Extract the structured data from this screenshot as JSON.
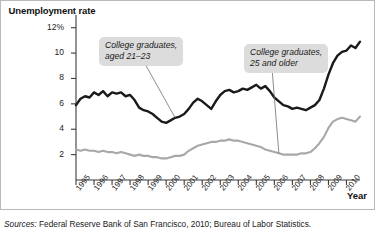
{
  "figure": {
    "y_axis_title": "Unemployment rate",
    "x_axis_title": "Year",
    "source_label": "Sources:",
    "source_text": " Federal Reserve Bank of San Francisco, 2010; Bureau of Labor Statistics."
  },
  "callouts": [
    {
      "id": "grads-21-23",
      "line1": "College graduates,",
      "line2": "aged 21–23"
    },
    {
      "id": "grads-25-older",
      "line1": "College graduates,",
      "line2": "25 and older"
    }
  ],
  "colors": {
    "series_young": "#1a1a1a",
    "series_older": "#a8a8a8",
    "axis": "#3b3b3b",
    "callout_bg": "#dcdcdc",
    "frame": "#b9b9b9",
    "background": "#ffffff"
  },
  "chart_data": {
    "type": "line",
    "title": "",
    "xlabel": "Year",
    "ylabel": "Unemployment rate",
    "ylim": [
      0,
      13
    ],
    "xlim": [
      1995,
      2010.75
    ],
    "grid": false,
    "legend": "annotations",
    "ytick_labels": [
      "2",
      "4",
      "6",
      "8",
      "10",
      "12%"
    ],
    "ytick_values": [
      2,
      4,
      6,
      8,
      10,
      12
    ],
    "xtick_labels": [
      "1995",
      "1996",
      "1997",
      "1998",
      "1999",
      "2000",
      "2001",
      "2002",
      "2003",
      "2004",
      "2005",
      "2006",
      "2007",
      "2008",
      "2009",
      "2010"
    ],
    "xtick_values": [
      1995,
      1996,
      1997,
      1998,
      1999,
      2000,
      2001,
      2002,
      2003,
      2004,
      2005,
      2006,
      2007,
      2008,
      2009,
      2010
    ],
    "annotations": [
      {
        "text": "College graduates, aged 21–23",
        "points_to_series": "College graduates, aged 21-23",
        "points_to_x": 2000.4
      },
      {
        "text": "College graduates, 25 and older",
        "points_to_series": "College graduates, 25 and older",
        "points_to_x": 2006.3
      }
    ],
    "series": [
      {
        "name": "College graduates, aged 21-23",
        "color": "#1a1a1a",
        "x": [
          1995.0,
          1995.25,
          1995.5,
          1995.75,
          1996.0,
          1996.25,
          1996.5,
          1996.75,
          1997.0,
          1997.25,
          1997.5,
          1997.75,
          1998.0,
          1998.25,
          1998.5,
          1998.75,
          1999.0,
          1999.25,
          1999.5,
          1999.75,
          2000.0,
          2000.25,
          2000.5,
          2000.75,
          2001.0,
          2001.25,
          2001.5,
          2001.75,
          2002.0,
          2002.25,
          2002.5,
          2002.75,
          2003.0,
          2003.25,
          2003.5,
          2003.75,
          2004.0,
          2004.25,
          2004.5,
          2004.75,
          2005.0,
          2005.25,
          2005.5,
          2005.75,
          2006.0,
          2006.25,
          2006.5,
          2006.75,
          2007.0,
          2007.25,
          2007.5,
          2007.75,
          2008.0,
          2008.25,
          2008.5,
          2008.75,
          2009.0,
          2009.25,
          2009.5,
          2009.75,
          2010.0,
          2010.25,
          2010.5,
          2010.75
        ],
        "y": [
          5.9,
          6.4,
          6.6,
          6.5,
          6.9,
          6.7,
          7.0,
          6.6,
          6.9,
          6.8,
          6.9,
          6.6,
          6.7,
          6.3,
          5.7,
          5.5,
          5.4,
          5.2,
          4.9,
          4.6,
          4.5,
          4.7,
          4.9,
          5.0,
          5.2,
          5.6,
          6.1,
          6.4,
          6.2,
          5.9,
          5.6,
          6.2,
          6.7,
          7.0,
          7.1,
          6.9,
          7.0,
          7.2,
          7.1,
          7.3,
          7.5,
          7.2,
          7.4,
          7.0,
          6.5,
          6.2,
          5.9,
          5.8,
          5.6,
          5.7,
          5.6,
          5.5,
          5.7,
          5.9,
          6.3,
          7.2,
          8.3,
          9.2,
          9.8,
          10.1,
          10.2,
          10.6,
          10.4,
          10.9
        ]
      },
      {
        "name": "College graduates, 25 and older",
        "color": "#a8a8a8",
        "x": [
          1995.0,
          1995.25,
          1995.5,
          1995.75,
          1996.0,
          1996.25,
          1996.5,
          1996.75,
          1997.0,
          1997.25,
          1997.5,
          1997.75,
          1998.0,
          1998.25,
          1998.5,
          1998.75,
          1999.0,
          1999.25,
          1999.5,
          1999.75,
          2000.0,
          2000.25,
          2000.5,
          2000.75,
          2001.0,
          2001.25,
          2001.5,
          2001.75,
          2002.0,
          2002.25,
          2002.5,
          2002.75,
          2003.0,
          2003.25,
          2003.5,
          2003.75,
          2004.0,
          2004.25,
          2004.5,
          2004.75,
          2005.0,
          2005.25,
          2005.5,
          2005.75,
          2006.0,
          2006.25,
          2006.5,
          2006.75,
          2007.0,
          2007.25,
          2007.5,
          2007.75,
          2008.0,
          2008.25,
          2008.5,
          2008.75,
          2009.0,
          2009.25,
          2009.5,
          2009.75,
          2010.0,
          2010.25,
          2010.5,
          2010.75
        ],
        "y": [
          2.4,
          2.3,
          2.4,
          2.3,
          2.3,
          2.2,
          2.3,
          2.2,
          2.2,
          2.1,
          2.2,
          2.1,
          2.0,
          1.9,
          2.0,
          1.9,
          1.9,
          1.8,
          1.8,
          1.7,
          1.7,
          1.8,
          1.9,
          1.9,
          2.0,
          2.3,
          2.5,
          2.7,
          2.8,
          2.9,
          3.0,
          3.0,
          3.1,
          3.1,
          3.2,
          3.1,
          3.1,
          3.0,
          2.9,
          2.8,
          2.7,
          2.6,
          2.4,
          2.3,
          2.2,
          2.1,
          2.0,
          2.0,
          2.0,
          2.0,
          2.1,
          2.1,
          2.2,
          2.5,
          2.9,
          3.4,
          4.1,
          4.6,
          4.8,
          4.9,
          4.8,
          4.7,
          4.6,
          5.0
        ]
      }
    ]
  }
}
